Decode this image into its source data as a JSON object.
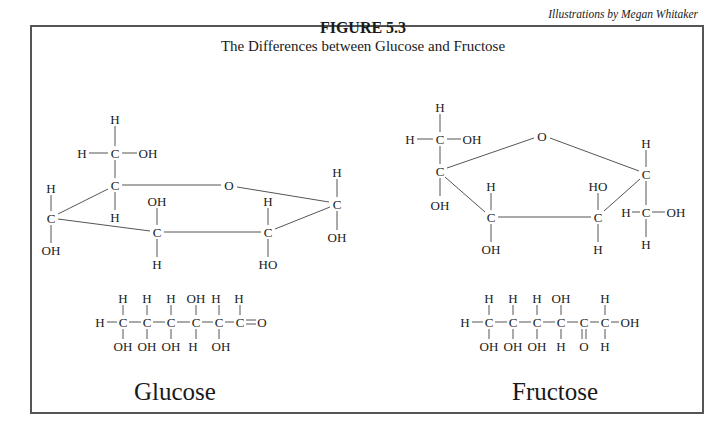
{
  "figure": {
    "credit": "Illustrations by Megan Whitaker",
    "title": "FIGURE 5.3",
    "subtitle": "The Differences between Glucose and Fructose"
  },
  "glucose": {
    "name": "Glucose",
    "ring_atoms": [
      {
        "t": "H",
        "x": 115,
        "y": 119
      },
      {
        "t": "H",
        "x": 82,
        "y": 153
      },
      {
        "t": "C",
        "x": 115,
        "y": 153
      },
      {
        "t": "OH",
        "x": 148,
        "y": 153
      },
      {
        "t": "C",
        "x": 115,
        "y": 185
      },
      {
        "t": "H",
        "x": 115,
        "y": 217
      },
      {
        "t": "O",
        "x": 229,
        "y": 185
      },
      {
        "t": "H",
        "x": 51,
        "y": 188
      },
      {
        "t": "C",
        "x": 51,
        "y": 218
      },
      {
        "t": "OH",
        "x": 51,
        "y": 250
      },
      {
        "t": "OH",
        "x": 157,
        "y": 201
      },
      {
        "t": "C",
        "x": 157,
        "y": 232
      },
      {
        "t": "H",
        "x": 157,
        "y": 264
      },
      {
        "t": "H",
        "x": 268,
        "y": 201
      },
      {
        "t": "C",
        "x": 268,
        "y": 232
      },
      {
        "t": "HO",
        "x": 268,
        "y": 264
      },
      {
        "t": "H",
        "x": 337,
        "y": 172
      },
      {
        "t": "C",
        "x": 337,
        "y": 204
      },
      {
        "t": "OH",
        "x": 337,
        "y": 237
      }
    ],
    "ring_bonds": [
      [
        115,
        126,
        115,
        146
      ],
      [
        89,
        153,
        108,
        153
      ],
      [
        122,
        153,
        137,
        153
      ],
      [
        115,
        160,
        115,
        178
      ],
      [
        115,
        192,
        115,
        210
      ],
      [
        122,
        185,
        221,
        185
      ],
      [
        237,
        187,
        329,
        202
      ],
      [
        51,
        195,
        51,
        211
      ],
      [
        51,
        225,
        51,
        243
      ],
      [
        58,
        214,
        108,
        189
      ],
      [
        58,
        219,
        150,
        231
      ],
      [
        157,
        208,
        157,
        225
      ],
      [
        157,
        239,
        157,
        257
      ],
      [
        164,
        232,
        261,
        232
      ],
      [
        268,
        208,
        268,
        225
      ],
      [
        268,
        239,
        268,
        257
      ],
      [
        275,
        229,
        330,
        207
      ],
      [
        337,
        179,
        337,
        197
      ],
      [
        337,
        211,
        337,
        230
      ]
    ],
    "linear_atoms": [
      {
        "t": "H",
        "x": 123,
        "y": 298
      },
      {
        "t": "H",
        "x": 147,
        "y": 298
      },
      {
        "t": "H",
        "x": 171,
        "y": 298
      },
      {
        "t": "OH",
        "x": 196,
        "y": 298
      },
      {
        "t": "H",
        "x": 216,
        "y": 298
      },
      {
        "t": "H",
        "x": 239,
        "y": 298
      },
      {
        "t": "H",
        "x": 100,
        "y": 322
      },
      {
        "t": "C",
        "x": 123,
        "y": 322
      },
      {
        "t": "C",
        "x": 147,
        "y": 322
      },
      {
        "t": "C",
        "x": 171,
        "y": 322
      },
      {
        "t": "C",
        "x": 196,
        "y": 322
      },
      {
        "t": "C",
        "x": 219,
        "y": 322
      },
      {
        "t": "C",
        "x": 240,
        "y": 322
      },
      {
        "t": "O",
        "x": 262,
        "y": 322
      },
      {
        "t": "OH",
        "x": 123,
        "y": 346
      },
      {
        "t": "OH",
        "x": 147,
        "y": 346
      },
      {
        "t": "OH",
        "x": 171,
        "y": 346
      },
      {
        "t": "H",
        "x": 193,
        "y": 346
      },
      {
        "t": "OH",
        "x": 221,
        "y": 346
      }
    ],
    "linear_bonds": [
      [
        107,
        322,
        117,
        322
      ],
      [
        129,
        322,
        141,
        322
      ],
      [
        153,
        322,
        165,
        322
      ],
      [
        177,
        322,
        190,
        322
      ],
      [
        202,
        322,
        213,
        322
      ],
      [
        225,
        322,
        234,
        322
      ],
      [
        246,
        320,
        256,
        320
      ],
      [
        246,
        324,
        256,
        324
      ],
      [
        123,
        305,
        123,
        315
      ],
      [
        147,
        305,
        147,
        315
      ],
      [
        171,
        305,
        171,
        315
      ],
      [
        196,
        305,
        196,
        315
      ],
      [
        219,
        305,
        219,
        315
      ],
      [
        240,
        305,
        240,
        315
      ],
      [
        123,
        329,
        123,
        339
      ],
      [
        147,
        329,
        147,
        339
      ],
      [
        171,
        329,
        171,
        339
      ],
      [
        196,
        329,
        196,
        339
      ],
      [
        219,
        329,
        219,
        339
      ]
    ]
  },
  "fructose": {
    "name": "Fructose",
    "ring_atoms": [
      {
        "t": "H",
        "x": 440,
        "y": 107
      },
      {
        "t": "H",
        "x": 410,
        "y": 139
      },
      {
        "t": "C",
        "x": 440,
        "y": 139
      },
      {
        "t": "OH",
        "x": 472,
        "y": 139
      },
      {
        "t": "C",
        "x": 440,
        "y": 171
      },
      {
        "t": "OH",
        "x": 440,
        "y": 205
      },
      {
        "t": "O",
        "x": 542,
        "y": 136
      },
      {
        "t": "H",
        "x": 491,
        "y": 186
      },
      {
        "t": "C",
        "x": 491,
        "y": 217
      },
      {
        "t": "OH",
        "x": 491,
        "y": 249
      },
      {
        "t": "HO",
        "x": 598,
        "y": 186
      },
      {
        "t": "C",
        "x": 598,
        "y": 217
      },
      {
        "t": "H",
        "x": 598,
        "y": 249
      },
      {
        "t": "H",
        "x": 646,
        "y": 143
      },
      {
        "t": "C",
        "x": 646,
        "y": 174
      },
      {
        "t": "H",
        "x": 626,
        "y": 212
      },
      {
        "t": "C",
        "x": 646,
        "y": 212
      },
      {
        "t": "OH",
        "x": 676,
        "y": 212
      },
      {
        "t": "H",
        "x": 646,
        "y": 244
      }
    ],
    "ring_bonds": [
      [
        440,
        114,
        440,
        132
      ],
      [
        417,
        139,
        433,
        139
      ],
      [
        447,
        139,
        461,
        139
      ],
      [
        440,
        146,
        440,
        164
      ],
      [
        440,
        178,
        440,
        196
      ],
      [
        447,
        168,
        534,
        138
      ],
      [
        550,
        138,
        639,
        171
      ],
      [
        445,
        177,
        485,
        212
      ],
      [
        491,
        193,
        491,
        210
      ],
      [
        491,
        224,
        491,
        242
      ],
      [
        498,
        217,
        591,
        217
      ],
      [
        598,
        193,
        598,
        210
      ],
      [
        598,
        224,
        598,
        242
      ],
      [
        604,
        211,
        640,
        179
      ],
      [
        646,
        150,
        646,
        167
      ],
      [
        646,
        181,
        646,
        205
      ],
      [
        632,
        212,
        640,
        212
      ],
      [
        652,
        212,
        665,
        212
      ],
      [
        646,
        219,
        646,
        237
      ]
    ],
    "linear_atoms": [
      {
        "t": "H",
        "x": 489,
        "y": 298
      },
      {
        "t": "H",
        "x": 513,
        "y": 298
      },
      {
        "t": "H",
        "x": 537,
        "y": 298
      },
      {
        "t": "OH",
        "x": 561,
        "y": 298
      },
      {
        "t": "H",
        "x": 605,
        "y": 298
      },
      {
        "t": "H",
        "x": 465,
        "y": 322
      },
      {
        "t": "C",
        "x": 489,
        "y": 322
      },
      {
        "t": "C",
        "x": 513,
        "y": 322
      },
      {
        "t": "C",
        "x": 537,
        "y": 322
      },
      {
        "t": "C",
        "x": 561,
        "y": 322
      },
      {
        "t": "C",
        "x": 584,
        "y": 322
      },
      {
        "t": "C",
        "x": 605,
        "y": 322
      },
      {
        "t": "OH",
        "x": 630,
        "y": 322
      },
      {
        "t": "OH",
        "x": 489,
        "y": 346
      },
      {
        "t": "OH",
        "x": 513,
        "y": 346
      },
      {
        "t": "OH",
        "x": 537,
        "y": 346
      },
      {
        "t": "H",
        "x": 561,
        "y": 346
      },
      {
        "t": "O",
        "x": 584,
        "y": 346
      },
      {
        "t": "H",
        "x": 605,
        "y": 346
      }
    ],
    "linear_bonds": [
      [
        472,
        322,
        483,
        322
      ],
      [
        495,
        322,
        507,
        322
      ],
      [
        519,
        322,
        531,
        322
      ],
      [
        543,
        322,
        555,
        322
      ],
      [
        567,
        322,
        578,
        322
      ],
      [
        590,
        322,
        599,
        322
      ],
      [
        611,
        322,
        619,
        322
      ],
      [
        489,
        305,
        489,
        315
      ],
      [
        513,
        305,
        513,
        315
      ],
      [
        537,
        305,
        537,
        315
      ],
      [
        561,
        305,
        561,
        315
      ],
      [
        605,
        305,
        605,
        315
      ],
      [
        489,
        329,
        489,
        339
      ],
      [
        513,
        329,
        513,
        339
      ],
      [
        537,
        329,
        537,
        339
      ],
      [
        561,
        329,
        561,
        339
      ],
      [
        605,
        329,
        605,
        339
      ],
      [
        582,
        329,
        582,
        339
      ],
      [
        586,
        329,
        586,
        339
      ]
    ]
  }
}
